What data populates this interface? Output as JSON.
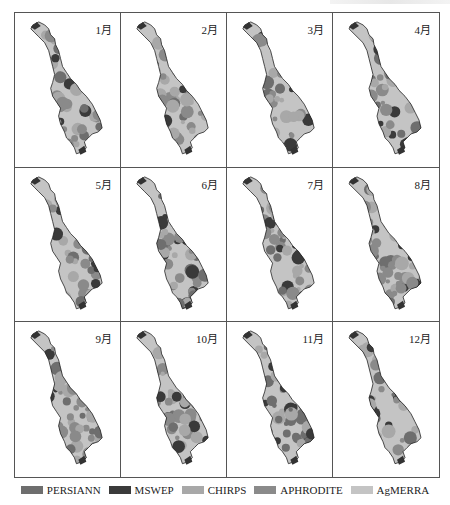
{
  "figure": {
    "panels": [
      {
        "label": "1月",
        "dominant_tone": "mixed",
        "dark_share": 0.25
      },
      {
        "label": "2月",
        "dominant_tone": "mixed",
        "dark_share": 0.3
      },
      {
        "label": "3月",
        "dominant_tone": "mixed",
        "dark_share": 0.35
      },
      {
        "label": "4月",
        "dominant_tone": "dark",
        "dark_share": 0.45
      },
      {
        "label": "5月",
        "dominant_tone": "mixed",
        "dark_share": 0.35
      },
      {
        "label": "6月",
        "dominant_tone": "mixed",
        "dark_share": 0.4
      },
      {
        "label": "7月",
        "dominant_tone": "mixed",
        "dark_share": 0.3
      },
      {
        "label": "8月",
        "dominant_tone": "mixed",
        "dark_share": 0.35
      },
      {
        "label": "9月",
        "dominant_tone": "light",
        "dark_share": 0.25
      },
      {
        "label": "10月",
        "dominant_tone": "light",
        "dark_share": 0.25
      },
      {
        "label": "11月",
        "dominant_tone": "dark",
        "dark_share": 0.45
      },
      {
        "label": "12月",
        "dominant_tone": "mixed",
        "dark_share": 0.35
      }
    ]
  },
  "legend": {
    "items": [
      {
        "label": "PERSIANN",
        "color": "#6e6e6e"
      },
      {
        "label": "MSWEP",
        "color": "#3a3a3a"
      },
      {
        "label": "CHIRPS",
        "color": "#a8a8a8"
      },
      {
        "label": "APHRODITE",
        "color": "#8a8a8a"
      },
      {
        "label": "AgMERRA",
        "color": "#c4c4c4"
      }
    ]
  }
}
